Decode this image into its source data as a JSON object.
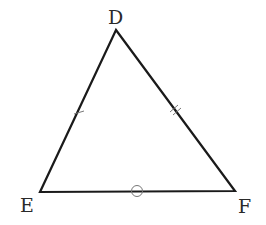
{
  "diagram": {
    "type": "triangle",
    "vertices": [
      {
        "label": "D",
        "x": 116,
        "y": 30
      },
      {
        "label": "E",
        "x": 40,
        "y": 192
      },
      {
        "label": "F",
        "x": 235,
        "y": 191
      }
    ],
    "markings": [
      {
        "side": "DE",
        "mark": "single tick"
      },
      {
        "side": "DF",
        "mark": "double tick"
      },
      {
        "side": "EF",
        "mark": "circle"
      }
    ],
    "stroke_color": "#1a1a1a",
    "mark_color": "#777777"
  }
}
